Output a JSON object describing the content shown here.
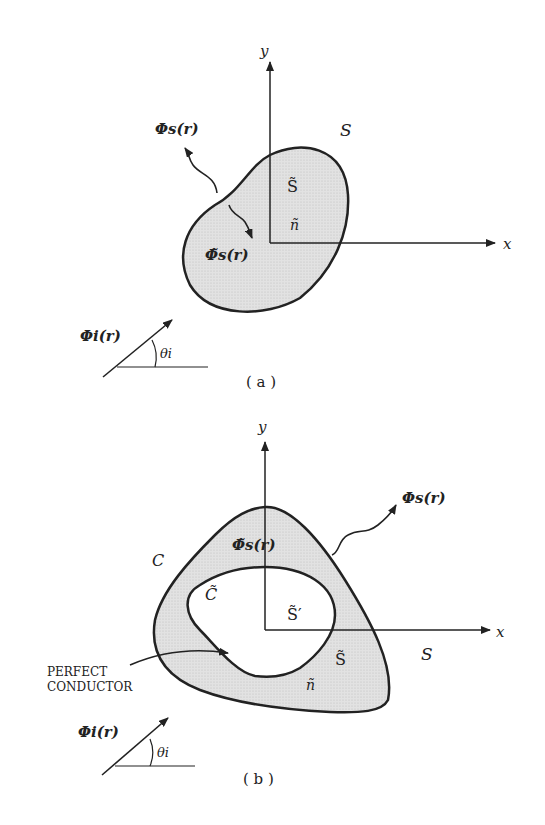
{
  "panel_a": {
    "caption": "( a )",
    "axis_x": "x",
    "axis_y": "y",
    "outer_region": "S",
    "inner_region": "S̃",
    "normal": "ñ",
    "scattered_outside": "Φs(r)",
    "scattered_inside": "Φ̃s(r)",
    "incident": "Φi(r)",
    "angle": "θi"
  },
  "panel_b": {
    "caption": "( b )",
    "axis_x": "x",
    "axis_y": "y",
    "outer_region": "S",
    "outer_contour": "C",
    "inner_contour": "C̃",
    "shell_region": "S̃",
    "cavity_region": "S̃′",
    "normal": "ñ",
    "scattered_outside": "Φs(r)",
    "scattered_inside": "Φ̃s(r)",
    "incident": "Φi(r)",
    "angle": "θi",
    "conductor_label_line1": "PERFECT",
    "conductor_label_line2": "CONDUCTOR"
  },
  "colors": {
    "ink": "#222222",
    "fill": "#d9d9d9"
  }
}
